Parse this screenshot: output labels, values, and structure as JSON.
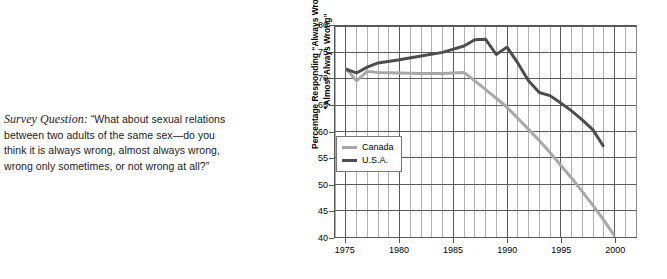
{
  "caption": {
    "lead": "Survey Question:",
    "text": " “What about sexual relations between two adults of the same sex—do you think it is always wrong, almost always wrong, wrong only sometimes, or not wrong at all?”"
  },
  "colors": {
    "canada": "#a8a8a8",
    "usa": "#4d4d4d",
    "grid_major": "#5a5a5a",
    "grid_minor": "#9a9a9a",
    "axis": "#555555"
  },
  "chart_data": {
    "type": "line",
    "title": "",
    "xlabel": "",
    "ylabel": "Percentage Responding “Always Wrong” or\n“Almost Always Wrong”",
    "xlim": [
      1974,
      2002
    ],
    "ylim": [
      40,
      80
    ],
    "ytick_labels": [
      "80",
      "75",
      "70",
      "65",
      "60",
      "55",
      "50",
      "45",
      "40"
    ],
    "yticks": [
      80,
      75,
      70,
      65,
      60,
      55,
      50,
      45,
      40
    ],
    "xtick_labels": [
      "1975",
      "1980",
      "1985",
      "1990",
      "1995",
      "2000"
    ],
    "xticks": [
      1975,
      1980,
      1985,
      1990,
      1995,
      2000
    ],
    "minor_x_step": 1,
    "grid": true,
    "legend_position": "center-left",
    "series": [
      {
        "name": "Canada",
        "color": "#a8a8a8",
        "x": [
          1975,
          1976,
          1977,
          1978,
          1980,
          1982,
          1984,
          1986,
          1988,
          1990,
          1991,
          1992,
          1993,
          1994,
          1995,
          1996,
          1997,
          1998,
          1999,
          2000
        ],
        "values": [
          72.0,
          69.6,
          71.4,
          71.2,
          71.1,
          71.0,
          71.0,
          71.2,
          68.0,
          64.6,
          62.5,
          60.4,
          58.3,
          56.0,
          53.6,
          51.2,
          48.6,
          46.0,
          43.2,
          40.2
        ]
      },
      {
        "name": "U.S.A.",
        "color": "#4d4d4d",
        "x": [
          1975,
          1976,
          1977,
          1978,
          1980,
          1982,
          1984,
          1986,
          1987,
          1988,
          1989,
          1990,
          1991,
          1992,
          1993,
          1994,
          1995,
          1996,
          1997,
          1998,
          1999
        ],
        "values": [
          71.8,
          71.1,
          72.2,
          73.0,
          73.6,
          74.3,
          75.0,
          76.2,
          77.4,
          77.5,
          74.6,
          76.0,
          73.0,
          69.6,
          67.4,
          66.8,
          65.4,
          63.9,
          62.2,
          60.3,
          57.1
        ]
      }
    ]
  },
  "legend": {
    "items": [
      {
        "label": "Canada",
        "color": "#a8a8a8"
      },
      {
        "label": "U.S.A.",
        "color": "#4d4d4d"
      }
    ]
  }
}
